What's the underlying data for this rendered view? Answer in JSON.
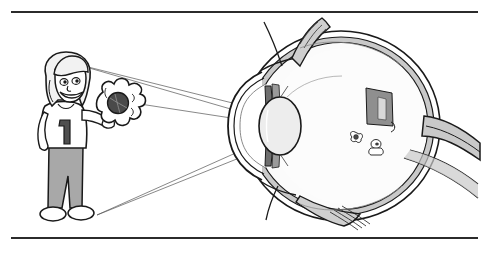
{
  "figure": {
    "title": "How the eye forms an image",
    "description": "Cross-section diagram of a human eye with light rays from a girl holding a flower converging through the lens to form an inverted image on the retina",
    "background_color": "#ffffff",
    "ink_color": "#1a1a1a",
    "rules": {
      "top_label": "figure-top-rule",
      "bottom_label": "figure-bottom-rule",
      "color": "#2b2b2b"
    }
  },
  "object_scene": {
    "label": "girl-holding-flower",
    "shirt_number": "1",
    "skin_tone": "#ffffff",
    "hair_color": "#f2f2f2",
    "shirt_color": "#ffffff",
    "pants_color": "#a8a8a8",
    "flower_color": "#ffffff",
    "flower_center_color": "#4a4a4a",
    "parts": [
      {
        "name": "head",
        "label": "girl-head"
      },
      {
        "name": "hair",
        "label": "girl-hair"
      },
      {
        "name": "face",
        "label": "girl-face"
      },
      {
        "name": "torso",
        "label": "girl-shirt"
      },
      {
        "name": "legs",
        "label": "girl-pants"
      },
      {
        "name": "shoes",
        "label": "girl-shoes"
      },
      {
        "name": "arm",
        "label": "girl-arm"
      },
      {
        "name": "flower",
        "label": "flower-object"
      }
    ]
  },
  "eye": {
    "label": "human-eye-cross-section",
    "sclera_color": "#ffffff",
    "choroid_color": "#c9c9c9",
    "vitreous_color": "#fbfbfb",
    "lens_color": "#ededed",
    "iris_color": "#6e6e6e",
    "retina_image_color": "#8f8f8f",
    "structures": [
      {
        "name": "cornea",
        "label": "cornea"
      },
      {
        "name": "anterior_chamber",
        "label": "anterior-chamber"
      },
      {
        "name": "iris",
        "label": "iris"
      },
      {
        "name": "pupil",
        "label": "pupil"
      },
      {
        "name": "lens",
        "label": "lens"
      },
      {
        "name": "vitreous_body",
        "label": "vitreous-body"
      },
      {
        "name": "sclera",
        "label": "sclera"
      },
      {
        "name": "choroid",
        "label": "choroid"
      },
      {
        "name": "retina",
        "label": "retina"
      },
      {
        "name": "optic_nerve",
        "label": "optic-nerve"
      },
      {
        "name": "superior_rectus_muscle",
        "label": "superior-rectus-muscle"
      },
      {
        "name": "inferior_rectus_muscle",
        "label": "inferior-rectus-muscle"
      },
      {
        "name": "retinal_image",
        "label": "inverted-retinal-image"
      }
    ]
  },
  "light_rays": {
    "label": "light-ray-bundle",
    "color": "#555555",
    "stroke_width": 0.7,
    "source_points": [
      {
        "name": "head-ray-origin",
        "x": 72,
        "y": 63
      },
      {
        "name": "feet-ray-origin",
        "x": 97,
        "y": 215
      }
    ],
    "convergence_point": {
      "name": "nodal-point",
      "x": 272,
      "y": 126
    },
    "image_points": [
      {
        "name": "image-top",
        "x": 374,
        "y": 96
      },
      {
        "name": "image-bottom",
        "x": 378,
        "y": 150
      }
    ],
    "rays": [
      {
        "from": "head-ray-origin",
        "to": "image-bottom"
      },
      {
        "from": "head-ray-origin",
        "to": "image-bottom-lower"
      },
      {
        "from": "feet-ray-origin",
        "to": "image-top"
      },
      {
        "from": "feet-ray-origin",
        "to": "image-top-upper"
      }
    ]
  }
}
